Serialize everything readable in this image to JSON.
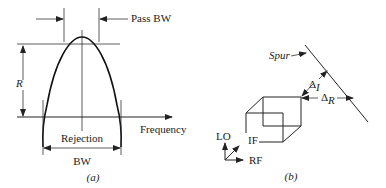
{
  "figure_a": {
    "caption": "(a)",
    "labels": {
      "pass_bw": "Pass BW",
      "r": "R",
      "frequency": "Frequency",
      "rejection": "Rejection",
      "bw": "BW"
    }
  },
  "figure_b": {
    "caption": "(b)",
    "labels": {
      "spur": "Spur",
      "delta_i": "Δ",
      "delta_i_sub": "I",
      "delta_r": "Δ",
      "delta_r_sub": "R",
      "lo": "LO",
      "if": "IF",
      "rf": "RF"
    }
  },
  "colors": {
    "line": "#222222",
    "background": "#ffffff"
  }
}
